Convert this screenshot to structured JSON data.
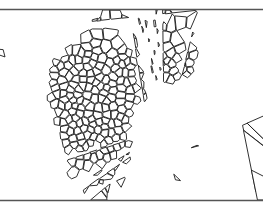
{
  "figure": {
    "background_color": "#ffffff",
    "cell_wall_color": "#1a1a1a",
    "cell_fill_color": "#ffffff",
    "platen_color": "#555555",
    "width": 263,
    "height": 208
  },
  "platens": {
    "top": {
      "name": "top-platen",
      "y": 9.5,
      "x1": 0,
      "x2": 263
    },
    "bottom": {
      "name": "bottom-platen",
      "y": 200.5,
      "x1": 0,
      "x2": 263
    }
  },
  "chart_data": {
    "type": "diagram",
    "xlabel": "",
    "ylabel": "",
    "cell_count": 474,
    "seed": 20240517,
    "region_note": "Foam specimen occupies an irregular domain with a notch cut from the right-hand side below mid-height",
    "density_note": "Cell size grades from large near the platens to small in the mid-height crush band"
  }
}
